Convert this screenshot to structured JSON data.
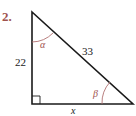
{
  "problem": {
    "number_label": "2.",
    "number_color": "#a0524e"
  },
  "triangle": {
    "side_vertical": "22",
    "side_hypotenuse": "33",
    "side_horizontal": "x",
    "angle_top": "α",
    "angle_right": "β",
    "line_color": "#1a1a1a",
    "angle_color": "#a0524e",
    "right_angle_marker": true
  }
}
